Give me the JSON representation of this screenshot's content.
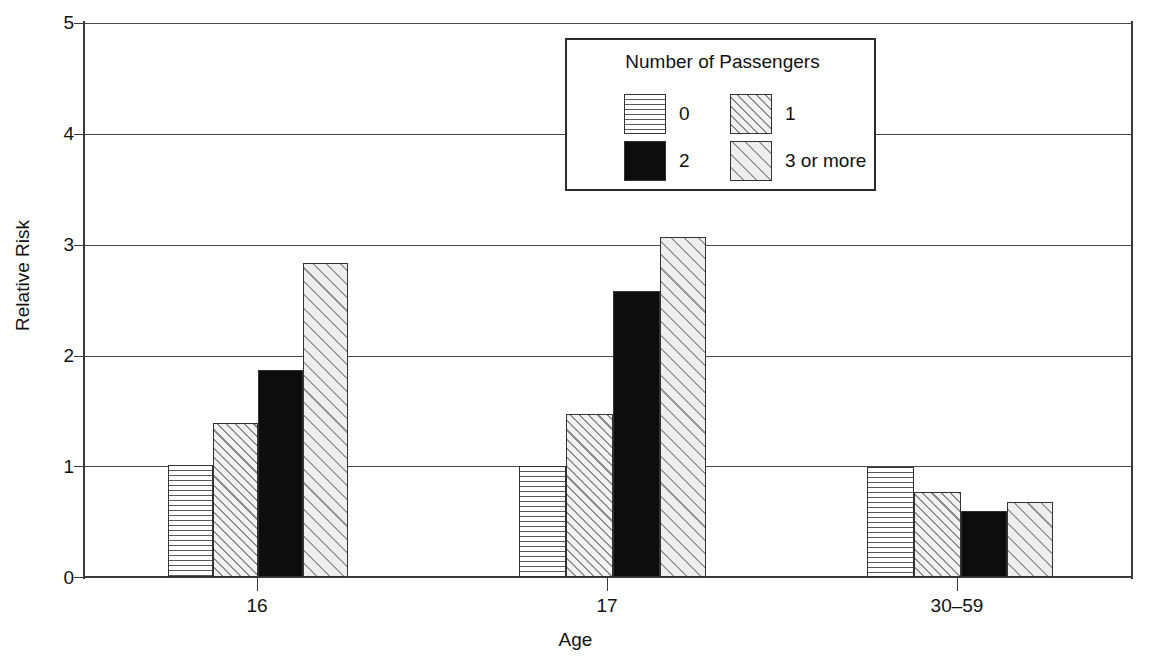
{
  "chart_data": {
    "type": "bar",
    "title": "",
    "xlabel": "Age",
    "ylabel": "Relative Risk",
    "categories": [
      "16",
      "17",
      "30–59"
    ],
    "ylim": [
      0,
      5
    ],
    "yticks": [
      "0",
      "1",
      "2",
      "3",
      "4",
      "5"
    ],
    "grid": true,
    "legend_position": "top-center-inside",
    "legend_title": "Number of Passengers",
    "series": [
      {
        "name": "0",
        "pattern": "horizontal-lines",
        "values": [
          1.01,
          1.0,
          0.99
        ]
      },
      {
        "name": "1",
        "pattern": "diagonal-dense",
        "values": [
          1.39,
          1.47,
          0.77
        ]
      },
      {
        "name": "2",
        "pattern": "solid-black",
        "values": [
          1.87,
          2.58,
          0.6
        ]
      },
      {
        "name": "3 or more",
        "pattern": "diagonal-light",
        "values": [
          2.83,
          3.07,
          0.68
        ]
      }
    ]
  },
  "axes": {
    "y_title": "Relative Risk",
    "x_title": "Age",
    "y_ticks": [
      {
        "label": "5",
        "value": 5
      },
      {
        "label": "4",
        "value": 4
      },
      {
        "label": "3",
        "value": 3
      },
      {
        "label": "2",
        "value": 2
      },
      {
        "label": "1",
        "value": 1
      },
      {
        "label": "0",
        "value": 0
      }
    ],
    "x_ticks": [
      {
        "label": "16"
      },
      {
        "label": "17"
      },
      {
        "label": "30–59"
      }
    ]
  },
  "legend": {
    "title": "Number of Passengers",
    "entries": [
      {
        "label": "0"
      },
      {
        "label": "1"
      },
      {
        "label": "2"
      },
      {
        "label": "3 or more"
      }
    ]
  },
  "colors": {
    "axis": "#3a3a3a",
    "grid": "#4a4a4a",
    "bar_outline": "#333333",
    "solid_fill": "#0d0d0d",
    "hatch": "#8d8d8d",
    "background": "#ffffff"
  }
}
